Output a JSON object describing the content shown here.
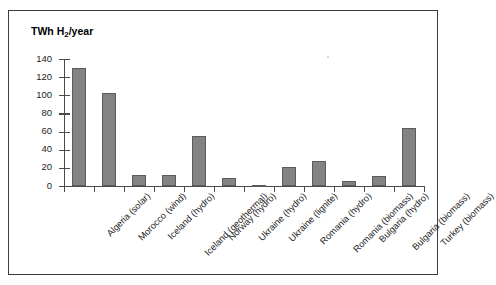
{
  "page": {
    "top_clipped_text": "Potentials"
  },
  "chart_data": {
    "type": "bar",
    "title": "",
    "ylabel": "TWh H2/year",
    "ylabel_parts": {
      "prefix": "TWh H",
      "sub": "2",
      "suffix": "/year"
    },
    "xlabel": "",
    "ylim": [
      0,
      140
    ],
    "yticks": [
      0,
      20,
      40,
      60,
      80,
      100,
      120,
      140
    ],
    "ytick_labels": [
      "0",
      "20",
      "40",
      "60",
      "80",
      "100",
      "120",
      "140"
    ],
    "grid": false,
    "legend": "none",
    "bar_color": "#838383",
    "bar_edge_color": "#5b5b5b",
    "axis_color": "#4a4a4a",
    "categories": [
      "Algeria (solar)",
      "Morocco (wind)",
      "Iceland (hydro)",
      "Iceland (geothermal)",
      "Norway (hydro)",
      "Ukraine (hydro)",
      "Ukraine (lignite)",
      "Romania (hydro)",
      "Romania (biomass)",
      "Bulgaria (hydro)",
      "Bulgaria (biomass)",
      "Turkey (biomass)"
    ],
    "values": [
      130,
      103,
      12.5,
      12.5,
      55,
      9,
      1.5,
      21,
      27.5,
      5,
      11.5,
      64
    ]
  }
}
